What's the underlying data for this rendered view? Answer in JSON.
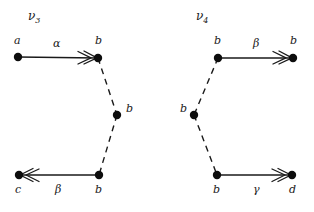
{
  "figure": {
    "width": 314,
    "height": 212,
    "background": "#ffffff",
    "ink_color": "#1a1a1a",
    "node_color": "#0d0d0d"
  },
  "diagrams": [
    {
      "id": "nu3",
      "title": "ν",
      "title_sub": "3",
      "title_pos": {
        "x": 28,
        "y": 20
      },
      "nodes": [
        {
          "id": "n3-a",
          "label": "a",
          "x": 18,
          "y": 57,
          "label_x": 14,
          "label_y": 44
        },
        {
          "id": "n3-b1",
          "label": "b",
          "x": 98,
          "y": 58,
          "label_x": 95,
          "label_y": 44
        },
        {
          "id": "n3-b2",
          "label": "b",
          "x": 117,
          "y": 115,
          "label_x": 126,
          "label_y": 112
        },
        {
          "id": "n3-b3",
          "label": "b",
          "x": 99,
          "y": 175,
          "label_x": 95,
          "label_y": 193
        },
        {
          "id": "n3-c",
          "label": "c",
          "x": 19,
          "y": 175,
          "label_x": 15,
          "label_y": 193
        }
      ],
      "edges": [
        {
          "id": "n3-e1",
          "from": "n3-a",
          "to": "n3-b1",
          "style": "solid",
          "arrow": "to",
          "label": "α",
          "label_x": 53,
          "label_y": 47
        },
        {
          "id": "n3-e2",
          "from": "n3-b1",
          "to": "n3-b2",
          "style": "dashed",
          "arrow": "none",
          "label": "",
          "label_x": 0,
          "label_y": 0
        },
        {
          "id": "n3-e3",
          "from": "n3-b2",
          "to": "n3-b3",
          "style": "dashed",
          "arrow": "none",
          "label": "",
          "label_x": 0,
          "label_y": 0
        },
        {
          "id": "n3-e4",
          "from": "n3-b3",
          "to": "n3-c",
          "style": "solid",
          "arrow": "to",
          "label": "β",
          "label_x": 55,
          "label_y": 193
        }
      ]
    },
    {
      "id": "nu4",
      "title": "ν",
      "title_sub": "4",
      "title_pos": {
        "x": 196,
        "y": 20
      },
      "nodes": [
        {
          "id": "n4-b1",
          "label": "b",
          "x": 218,
          "y": 58,
          "label_x": 214,
          "label_y": 44
        },
        {
          "id": "n4-b4",
          "label": "b",
          "x": 293,
          "y": 58,
          "label_x": 290,
          "label_y": 44
        },
        {
          "id": "n4-b2",
          "label": "b",
          "x": 194,
          "y": 115,
          "label_x": 180,
          "label_y": 112
        },
        {
          "id": "n4-b3",
          "label": "b",
          "x": 217,
          "y": 175,
          "label_x": 213,
          "label_y": 193
        },
        {
          "id": "n4-d",
          "label": "d",
          "x": 292,
          "y": 175,
          "label_x": 289,
          "label_y": 193
        }
      ],
      "edges": [
        {
          "id": "n4-e1",
          "from": "n4-b1",
          "to": "n4-b4",
          "style": "solid",
          "arrow": "to",
          "label": "β",
          "label_x": 253,
          "label_y": 47
        },
        {
          "id": "n4-e2",
          "from": "n4-b1",
          "to": "n4-b2",
          "style": "dashed",
          "arrow": "none",
          "label": "",
          "label_x": 0,
          "label_y": 0
        },
        {
          "id": "n4-e3",
          "from": "n4-b2",
          "to": "n4-b3",
          "style": "dashed",
          "arrow": "none",
          "label": "",
          "label_x": 0,
          "label_y": 0
        },
        {
          "id": "n4-e4",
          "from": "n4-b3",
          "to": "n4-d",
          "style": "solid",
          "arrow": "to",
          "label": "γ",
          "label_x": 253,
          "label_y": 193
        }
      ]
    }
  ]
}
